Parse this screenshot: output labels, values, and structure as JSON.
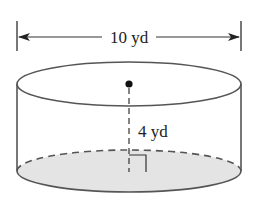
{
  "figure": {
    "type": "cylinder",
    "diameter_label": "10 yd",
    "height_label": "4 yd",
    "colors": {
      "stroke": "#555555",
      "base_fill": "#e4e4e4",
      "text": "#222222",
      "background": "#ffffff"
    }
  }
}
